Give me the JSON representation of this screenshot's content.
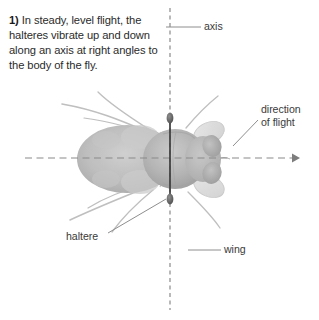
{
  "figure": {
    "caption": {
      "number": "1)",
      "text": " In steady, level flight, the halteres vibrate up and down along an axis at right angles to the body of the fly."
    },
    "labels": {
      "axis": "axis",
      "direction_line1": "direction",
      "direction_line2": "of flight",
      "haltere": "haltere",
      "wing": "wing"
    },
    "colors": {
      "background": "#ffffff",
      "caption_text": "#2b2b2b",
      "label_text": "#3a3a3a",
      "axis_line": "#8a8a8a",
      "flight_arrow": "#8a8a8a",
      "haltere_stem": "#3c3c3c",
      "haltere_knob": "#6b6b6b",
      "fly_body": "#b9b9b9",
      "fly_wing": "#dcdcdc",
      "leader_line": "#8e8e8e"
    },
    "elements": {
      "vertical_axis_name": "vibration-axis",
      "horizontal_axis_name": "flight-direction-arrow",
      "subject": "housefly-dorsal-view"
    }
  }
}
